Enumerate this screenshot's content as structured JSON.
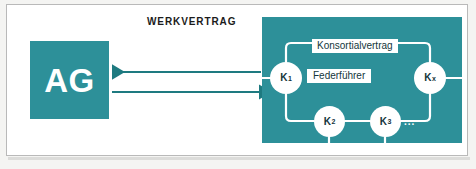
{
  "diagram": {
    "title": "WERKVERTRAG",
    "client": {
      "label": "AG"
    },
    "consortium": {
      "contract_label": "Konsortialvertrag",
      "lead_label": "Federführer",
      "ellipsis": "...",
      "nodes": [
        {
          "id": "k1",
          "base": "K",
          "sub": "1"
        },
        {
          "id": "kx",
          "base": "K",
          "sub": "x"
        },
        {
          "id": "k2",
          "base": "K",
          "sub": "2"
        },
        {
          "id": "k3",
          "base": "K",
          "sub": "3"
        }
      ]
    },
    "arrows": [
      {
        "id": "arrow-to-client",
        "direction": "left"
      },
      {
        "id": "arrow-to-consortium",
        "direction": "right"
      }
    ],
    "colors": {
      "teal": "#2d9099",
      "arrow": "#1e7a80",
      "connector": "#ffffff",
      "text_dark": "#13363c",
      "page": "#ffffff",
      "frame_border": "#b9b9b9"
    }
  }
}
